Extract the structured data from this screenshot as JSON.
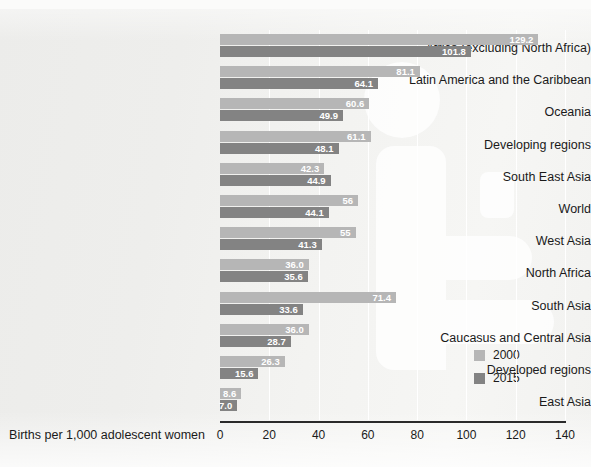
{
  "page": {
    "top_cut_text": "",
    "background_note": "scanned-page-grayscale"
  },
  "legend": {
    "position": "inside-bottom-right",
    "entries": [
      {
        "label": "2000",
        "color": "#b6b6b6"
      },
      {
        "label": "2015",
        "color": "#838383"
      }
    ]
  },
  "axis": {
    "title": "Births per 1,000 adolescent women",
    "ticks": [
      "0",
      "20",
      "40",
      "60",
      "80",
      "100",
      "120",
      "140"
    ]
  },
  "chart_data": {
    "type": "bar",
    "orientation": "horizontal",
    "title": "",
    "xlabel": "Births per 1,000 adolescent women",
    "ylabel": "",
    "xlim": [
      0,
      140
    ],
    "xticks": [
      0,
      20,
      40,
      60,
      80,
      100,
      120,
      140
    ],
    "grid": true,
    "legend_position": "lower right",
    "categories": [
      "Africa (excluding North Africa)",
      "Latin America and the Caribbean",
      "Oceania",
      "Developing regions",
      "South East Asia",
      "World",
      "West Asia",
      "North Africa",
      "South Asia",
      "Caucasus and Central Asia",
      "Developed regions",
      "East Asia"
    ],
    "series": [
      {
        "name": "2000",
        "color": "#b6b6b6",
        "values": [
          129.2,
          81.1,
          60.6,
          61.1,
          42.3,
          56,
          55,
          36.0,
          71.4,
          36.0,
          26.3,
          8.6
        ],
        "labels": [
          "129.2",
          "81.1",
          "60.6",
          "61.1",
          "42.3",
          "56",
          "55",
          "36.0",
          "71.4",
          "36.0",
          "26.3",
          "8.6"
        ]
      },
      {
        "name": "2015",
        "color": "#838383",
        "values": [
          101.8,
          64.1,
          49.9,
          48.1,
          44.9,
          44.1,
          41.3,
          35.6,
          33.6,
          28.7,
          15.6,
          7.0
        ],
        "labels": [
          "101.8",
          "64.1",
          "49.9",
          "48.1",
          "44.9",
          "44.1",
          "41.3",
          "35.6",
          "33.6",
          "28.7",
          "15.6",
          "7.0"
        ]
      }
    ]
  }
}
